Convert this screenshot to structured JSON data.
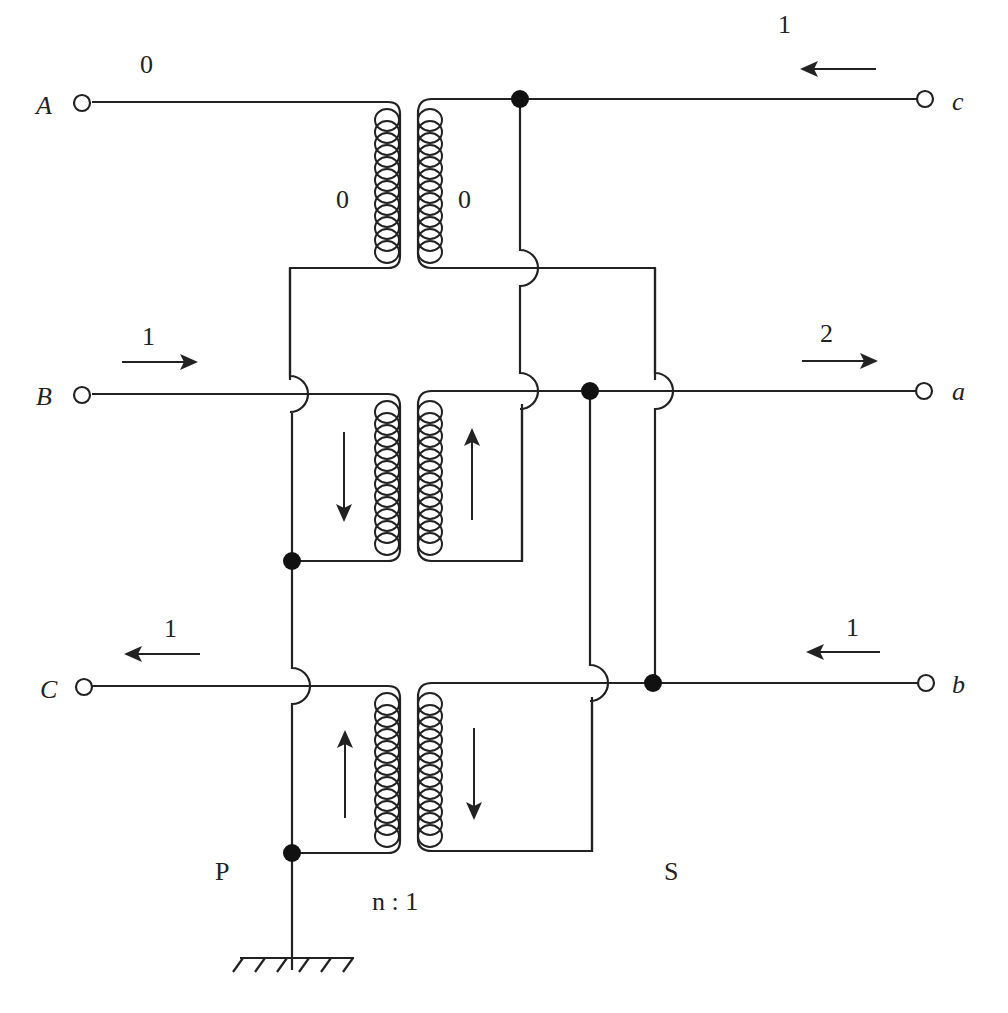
{
  "diagram": {
    "title": "",
    "terminals": {
      "primary": [
        {
          "id": "A",
          "label": "A"
        },
        {
          "id": "B",
          "label": "B"
        },
        {
          "id": "C",
          "label": "C"
        }
      ],
      "secondary": [
        {
          "id": "c",
          "label": "c"
        },
        {
          "id": "a",
          "label": "a"
        },
        {
          "id": "b",
          "label": "b"
        }
      ]
    },
    "line_currents": {
      "A": {
        "value": "0",
        "direction": "none"
      },
      "B": {
        "value": "1",
        "direction": "right"
      },
      "C": {
        "value": "1",
        "direction": "left"
      },
      "c": {
        "value": "1",
        "direction": "left"
      },
      "a": {
        "value": "2",
        "direction": "right"
      },
      "b": {
        "value": "1",
        "direction": "left"
      }
    },
    "winding_currents": {
      "top_primary": "0",
      "top_secondary": "0",
      "middle_primary_arrow": "down",
      "middle_secondary_arrow": "up",
      "bottom_primary_arrow": "up",
      "bottom_secondary_arrow": "down"
    },
    "labels": {
      "primary_side": "P",
      "secondary_side": "S",
      "turns_ratio": "n : 1"
    },
    "ground": "ground-symbol"
  }
}
